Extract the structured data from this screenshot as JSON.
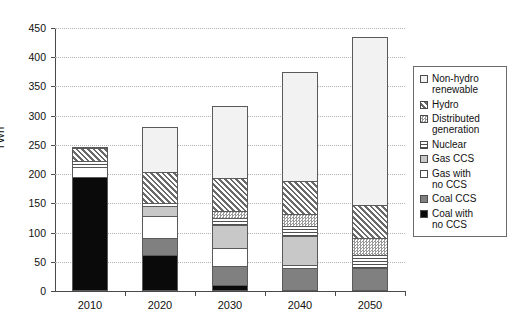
{
  "chart_data": {
    "type": "bar",
    "subtype": "stacked-bar",
    "title": "",
    "xlabel": "",
    "ylabel": "TWh",
    "ylim": [
      0,
      450
    ],
    "yticks": [
      0,
      50,
      100,
      150,
      200,
      250,
      300,
      350,
      400,
      450
    ],
    "grid": true,
    "legend_position": "right",
    "categories": [
      "2010",
      "2020",
      "2030",
      "2040",
      "2050"
    ],
    "series": [
      {
        "name": "Coal with no CCS",
        "swatch": "solid-black",
        "color": "#0a0a0a",
        "values": [
          195,
          62,
          10,
          0,
          0
        ]
      },
      {
        "name": "Coal CCS",
        "swatch": "solid-dark-gray",
        "color": "#808080",
        "values": [
          0,
          28,
          32,
          40,
          40
        ]
      },
      {
        "name": "Gas with no CCS",
        "swatch": "solid-white",
        "color": "#ffffff",
        "values": [
          17,
          38,
          31,
          4,
          0
        ]
      },
      {
        "name": "Gas CCS",
        "swatch": "light-gray",
        "color": "#c8c8c8",
        "values": [
          0,
          17,
          40,
          50,
          0
        ]
      },
      {
        "name": "Nuclear",
        "swatch": "horizontal-lines",
        "color": "#4f4f4f",
        "values": [
          10,
          5,
          12,
          18,
          22
        ]
      },
      {
        "name": "Distributed generation",
        "swatch": "fine-checker",
        "color": "#9a9a9a",
        "values": [
          0,
          0,
          12,
          20,
          28
        ]
      },
      {
        "name": "Hydro",
        "swatch": "diagonal-hatch",
        "color": "#6a6a6a",
        "values": [
          22,
          53,
          56,
          57,
          58
        ]
      },
      {
        "name": "Non-hydro renewable",
        "swatch": "very-light-gray",
        "color": "#f2f2f2",
        "values": [
          2,
          77,
          124,
          186,
          287
        ]
      }
    ],
    "totals": [
      246,
      280,
      317,
      375,
      435
    ]
  },
  "axis": {
    "y_title": "TWh",
    "y_tick_labels": [
      "450",
      "400",
      "350",
      "300",
      "250",
      "200",
      "150",
      "100",
      "50",
      "0"
    ],
    "x_tick_labels": [
      "2010",
      "2020",
      "2030",
      "2040",
      "2050"
    ]
  },
  "legend": {
    "items": [
      {
        "label_line1": "Non-hydro",
        "label_line2": "renewable"
      },
      {
        "label_line1": "Hydro",
        "label_line2": ""
      },
      {
        "label_line1": "Distributed",
        "label_line2": "generation"
      },
      {
        "label_line1": "Nuclear",
        "label_line2": ""
      },
      {
        "label_line1": "Gas CCS",
        "label_line2": ""
      },
      {
        "label_line1": "Gas with",
        "label_line2": "no CCS"
      },
      {
        "label_line1": "Coal CCS",
        "label_line2": ""
      },
      {
        "label_line1": "Coal with",
        "label_line2": "no CCS"
      }
    ]
  }
}
